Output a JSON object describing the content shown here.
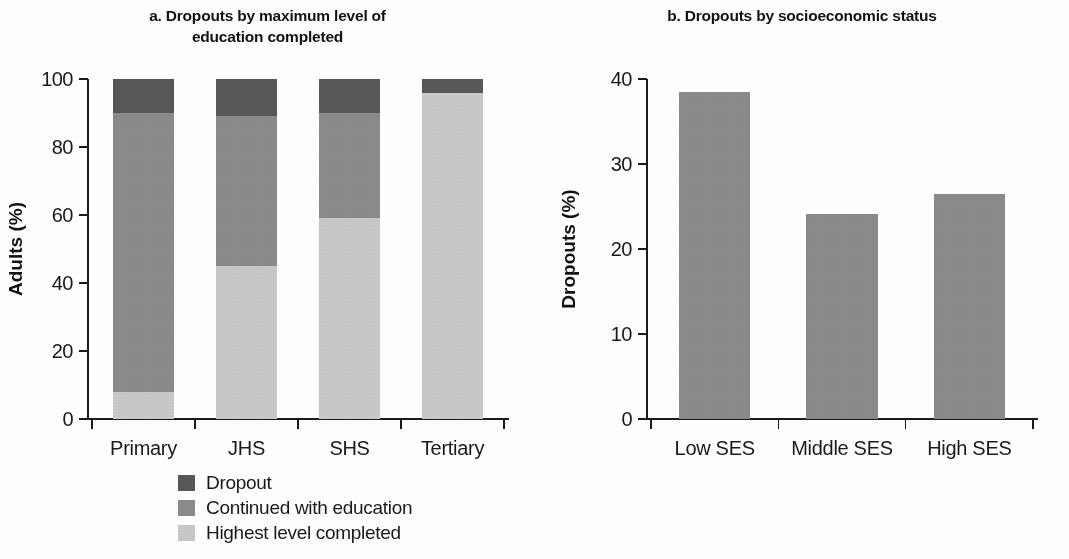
{
  "figure": {
    "background_color": "#fdfdfc"
  },
  "panel_a": {
    "title": "a. Dropouts by maximum level of education completed",
    "title_line1": "a. Dropouts by maximum level of",
    "title_line2": "education completed",
    "ylabel": "Adults (%)"
  },
  "panel_b": {
    "title": "b. Dropouts by socioeconomic status",
    "ylabel": "Dropouts (%)"
  },
  "legend": {
    "items": [
      {
        "label": "Dropout",
        "color": "#585858"
      },
      {
        "label": "Continued with education",
        "color": "#8b8b8b"
      },
      {
        "label": "Highest level completed",
        "color": "#c9c9c9"
      }
    ]
  },
  "chart_data": [
    {
      "type": "bar",
      "subtype": "stacked-100",
      "panel": "a",
      "title": "a. Dropouts by maximum level of education completed",
      "xlabel": "",
      "ylabel": "Adults (%)",
      "ylim": [
        0,
        100
      ],
      "yticks": [
        0,
        20,
        40,
        60,
        80,
        100
      ],
      "ytick_labels": [
        "0",
        "20",
        "40",
        "60",
        "80",
        "100"
      ],
      "grid": false,
      "legend_position": "below-left",
      "categories": [
        "Primary",
        "JHS",
        "SHS",
        "Tertiary"
      ],
      "series": [
        {
          "name": "Highest level completed",
          "color": "#c9c9c9",
          "values": [
            8,
            45,
            59,
            96
          ]
        },
        {
          "name": "Continued with education",
          "color": "#8b8b8b",
          "values": [
            82,
            44,
            31,
            0
          ]
        },
        {
          "name": "Dropout",
          "color": "#585858",
          "values": [
            10,
            11,
            10,
            4
          ]
        }
      ],
      "cumulative_tops": {
        "Primary": {
          "highest_level_completed": 8,
          "continued_with_education": 90,
          "dropout": 100
        },
        "JHS": {
          "highest_level_completed": 45,
          "continued_with_education": 89,
          "dropout": 100
        },
        "SHS": {
          "highest_level_completed": 59,
          "continued_with_education": 90,
          "dropout": 100
        },
        "Tertiary": {
          "highest_level_completed": 96,
          "continued_with_education": 96,
          "dropout": 100
        }
      }
    },
    {
      "type": "bar",
      "panel": "b",
      "title": "b. Dropouts by socioeconomic status",
      "xlabel": "",
      "ylabel": "Dropouts (%)",
      "ylim": [
        0,
        40
      ],
      "yticks": [
        0,
        10,
        20,
        30,
        40
      ],
      "ytick_labels": [
        "0",
        "10",
        "20",
        "30",
        "40"
      ],
      "grid": false,
      "bar_color": "#8b8b8b",
      "categories": [
        "Low SES",
        "Middle SES",
        "High SES"
      ],
      "values": [
        38.5,
        24.1,
        26.5
      ]
    }
  ]
}
